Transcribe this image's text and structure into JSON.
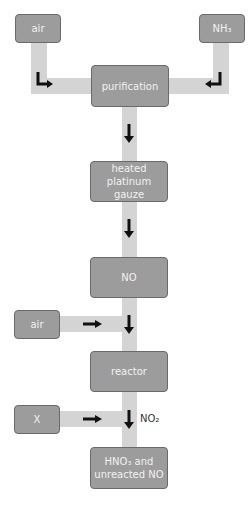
{
  "diagram": {
    "type": "process-flow",
    "nodes": {
      "air_top": "air",
      "nh3": "NH₃",
      "purification": "purification",
      "gauze_line1": "heated",
      "gauze_line2": "platinum gauze",
      "no": "NO",
      "air_side": "air",
      "reactor": "reactor",
      "x": "X",
      "product_line1": "HNO₃ and",
      "product_line2": "unreacted NO"
    },
    "edge_labels": {
      "no2": "NO₂"
    },
    "edges": [
      [
        "air",
        "purification"
      ],
      [
        "NH3",
        "purification"
      ],
      [
        "purification",
        "heated platinum gauze"
      ],
      [
        "heated platinum gauze",
        "NO"
      ],
      [
        "NO",
        "reactor"
      ],
      [
        "air",
        "reactor"
      ],
      [
        "reactor",
        "HNO3 and unreacted NO"
      ],
      [
        "X",
        "HNO3 and unreacted NO"
      ]
    ],
    "colors": {
      "box_fill": "#9c9c9c",
      "pipe": "#d4d4d4",
      "arrow": "#111111"
    }
  }
}
